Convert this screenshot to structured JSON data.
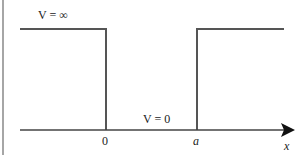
{
  "diagram": {
    "labels": {
      "v_outside": "V = ∞",
      "v_inside": "V = 0",
      "origin": "0",
      "well_width": "a",
      "axis": "x"
    },
    "colors": {
      "line": "#555555",
      "frame": "#888888",
      "text": "#222222",
      "background": "#ffffff"
    }
  }
}
